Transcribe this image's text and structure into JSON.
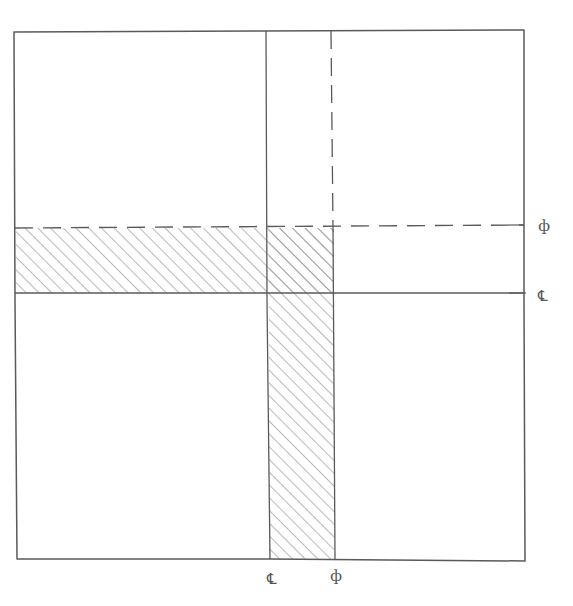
{
  "diagram": {
    "type": "plan-sketch",
    "style": "hand-drawn pencil",
    "colors": {
      "line": "#5a5a5a",
      "hatch": "#9a9a9a",
      "background": "#ffffff"
    },
    "frame": {
      "x1": 15,
      "y1": 31,
      "x2": 524,
      "y2": 560
    },
    "vertical_band": {
      "solid_line_x": 268,
      "dashed_line_x": 334,
      "hatched_from_y": 227,
      "hatched_to_y": 560
    },
    "horizontal_band": {
      "dashed_line_y": 227,
      "solid_line_y": 293,
      "hatched_from_x": 15,
      "hatched_to_x": 334
    },
    "labels": {
      "right_dashed": "ф",
      "right_solid": "℄",
      "bottom_solid": "℄",
      "bottom_dashed": "ф"
    }
  }
}
